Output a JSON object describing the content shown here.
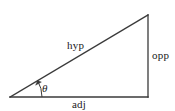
{
  "figure": {
    "kind": "right-triangle-trigonometry-diagram",
    "background_color": "#ffffff",
    "stroke_color": "#3a3a3a",
    "text_color": "#1a1a1a"
  },
  "labels": {
    "hypotenuse": "hyp",
    "opposite": "opp",
    "adjacent": "adj",
    "angle": "θ"
  },
  "geometry": {
    "vertex_left": {
      "x": 10,
      "y": 97
    },
    "vertex_top_right": {
      "x": 148,
      "y": 15
    },
    "vertex_bottom_right": {
      "x": 148,
      "y": 97
    },
    "angle_arc": {
      "center": {
        "x": 10,
        "y": 97
      },
      "radius": 32,
      "start_deg": 0,
      "end_deg": 31
    }
  }
}
